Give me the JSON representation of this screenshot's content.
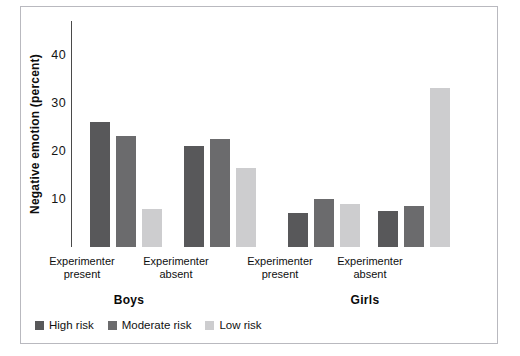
{
  "chart_data": {
    "type": "bar",
    "title": "",
    "xlabel": "",
    "ylabel": "Negative emotion (percent)",
    "ylim": [
      0,
      47
    ],
    "yticks": [
      10,
      20,
      30,
      40
    ],
    "grid": false,
    "legend_position": "bottom-left",
    "supergroups": [
      {
        "label": "Boys"
      },
      {
        "label": "Girls"
      }
    ],
    "categories": [
      "Experimenter present",
      "Experimenter absent",
      "Experimenter present",
      "Experimenter absent"
    ],
    "category_lines": [
      {
        "line1": "Experimenter",
        "line2": "present"
      },
      {
        "line1": "Experimenter",
        "line2": "absent"
      },
      {
        "line1": "Experimenter",
        "line2": "present"
      },
      {
        "line1": "Experimenter",
        "line2": "absent"
      }
    ],
    "series": [
      {
        "name": "High risk",
        "color": "#58585a",
        "values": [
          26,
          21,
          7,
          7.5
        ]
      },
      {
        "name": "Moderate risk",
        "color": "#6b6b6d",
        "values": [
          23,
          22.5,
          10,
          8.5
        ]
      },
      {
        "name": "Low risk",
        "color": "#cdcdcf",
        "values": [
          8,
          16.5,
          9,
          33
        ]
      }
    ]
  },
  "legend": {
    "items": [
      {
        "label": "High risk"
      },
      {
        "label": "Moderate risk"
      },
      {
        "label": "Low risk"
      }
    ]
  }
}
